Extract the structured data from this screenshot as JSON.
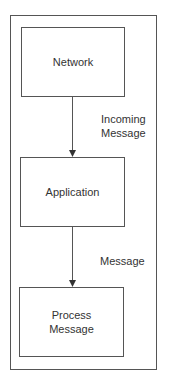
{
  "diagram": {
    "nodes": [
      {
        "id": "network",
        "label": "Network"
      },
      {
        "id": "application",
        "label": "Application"
      },
      {
        "id": "process-message",
        "label": "Process Message"
      }
    ],
    "edges": [
      {
        "from": "network",
        "to": "application",
        "label": "Incoming Message"
      },
      {
        "from": "application",
        "to": "process-message",
        "label": "Message"
      }
    ],
    "colors": {
      "stroke": "#555555",
      "text": "#333333",
      "background": "#ffffff"
    }
  }
}
